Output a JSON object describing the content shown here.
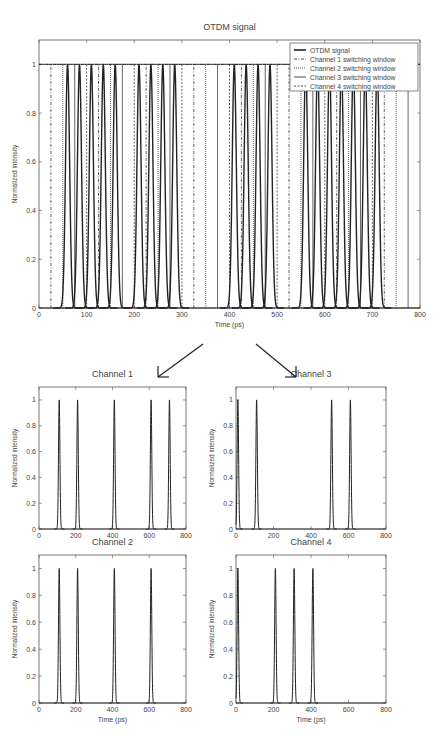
{
  "chart_data": [
    {
      "id": "main",
      "type": "line",
      "title": "OTDM signal",
      "xlabel": "Time (ps)",
      "ylabel": "Normalized intensity",
      "xlim": [
        0,
        800
      ],
      "ylim": [
        0,
        1.1
      ],
      "xticks": [
        0,
        100,
        200,
        300,
        400,
        500,
        600,
        700,
        800
      ],
      "yticks": [
        0,
        0.2,
        0.4,
        0.6,
        0.8,
        1
      ],
      "grid": false,
      "legend_position": "upper right",
      "legend": [
        {
          "label": "OTDM signal",
          "style": "solid-thick"
        },
        {
          "label": "Channel 1 switching window",
          "style": "dashdot"
        },
        {
          "label": "Channel 2 switching window",
          "style": "dotted"
        },
        {
          "label": "Channel 3 switching window",
          "style": "solid"
        },
        {
          "label": "Channel 4 switching window",
          "style": "dashed"
        }
      ],
      "series": [
        {
          "name": "OTDM signal",
          "pulse_centers_ps": [
            60,
            85,
            110,
            135,
            160,
            210,
            235,
            260,
            285,
            410,
            435,
            460,
            485,
            560,
            585,
            610,
            635,
            660,
            685,
            710
          ],
          "peak": 1.0,
          "pulse_width_ps": 10
        },
        {
          "name": "Channel 1 switching window",
          "window_edges_ps": [
            25,
            125,
            225,
            325,
            425,
            525,
            625,
            725
          ]
        },
        {
          "name": "Channel 2 switching window",
          "window_edges_ps": [
            50,
            150,
            250,
            350,
            450,
            550,
            650,
            750
          ]
        },
        {
          "name": "Channel 3 switching window",
          "window_edges_ps": [
            75,
            175,
            275,
            375,
            475,
            575,
            675,
            775
          ]
        },
        {
          "name": "Channel 4 switching window",
          "window_edges_ps": [
            0,
            100,
            200,
            300,
            400,
            500,
            600,
            700
          ]
        }
      ]
    },
    {
      "id": "ch1",
      "type": "line",
      "title": "Channel 1",
      "xlabel": "",
      "ylabel": "Normalized intensity",
      "xlim": [
        0,
        800
      ],
      "ylim": [
        0,
        1.1
      ],
      "xticks": [
        0,
        200,
        400,
        600,
        800
      ],
      "yticks": [
        0,
        0.2,
        0.4,
        0.6,
        0.8,
        1
      ],
      "series": [
        {
          "name": "Channel 1",
          "pulse_centers_ps": [
            110,
            210,
            410,
            610,
            710
          ],
          "peak": 1.0
        }
      ]
    },
    {
      "id": "ch3",
      "type": "line",
      "title": "Channel 3",
      "xlabel": "",
      "ylabel": "Normalized intensity",
      "xlim": [
        0,
        800
      ],
      "ylim": [
        0,
        1.1
      ],
      "xticks": [
        0,
        200,
        400,
        600,
        800
      ],
      "yticks": [
        0,
        0.2,
        0.4,
        0.6,
        0.8,
        1
      ],
      "series": [
        {
          "name": "Channel 3",
          "pulse_centers_ps": [
            10,
            110,
            510,
            610
          ],
          "peak": 1.0
        }
      ]
    },
    {
      "id": "ch2",
      "type": "line",
      "title": "Channel 2",
      "xlabel": "Time (ps)",
      "ylabel": "Normalized intensity",
      "xlim": [
        0,
        800
      ],
      "ylim": [
        0,
        1.1
      ],
      "xticks": [
        0,
        200,
        400,
        600,
        800
      ],
      "yticks": [
        0,
        0.2,
        0.4,
        0.6,
        0.8,
        1
      ],
      "series": [
        {
          "name": "Channel 2",
          "pulse_centers_ps": [
            110,
            210,
            410,
            610
          ],
          "peak": 1.0
        }
      ]
    },
    {
      "id": "ch4",
      "type": "line",
      "title": "Channel 4",
      "xlabel": "Time (ps)",
      "ylabel": "Normalized intensity",
      "xlim": [
        0,
        800
      ],
      "ylim": [
        0,
        1.1
      ],
      "xticks": [
        0,
        200,
        400,
        600,
        800
      ],
      "yticks": [
        0,
        0.2,
        0.4,
        0.6,
        0.8,
        1
      ],
      "series": [
        {
          "name": "Channel 4",
          "pulse_centers_ps": [
            10,
            210,
            310,
            410
          ],
          "peak": 1.0
        }
      ]
    }
  ],
  "layout": {
    "main": {
      "x": 39,
      "y": 40,
      "w": 381,
      "h": 268,
      "title_y": 22
    },
    "ch1": {
      "x": 39,
      "y": 387,
      "w": 147,
      "h": 142,
      "title_y": 369
    },
    "ch3": {
      "x": 236,
      "y": 387,
      "w": 150,
      "h": 142,
      "title_y": 369
    },
    "ch2": {
      "x": 39,
      "y": 555,
      "w": 147,
      "h": 148,
      "title_y": 537
    },
    "ch4": {
      "x": 236,
      "y": 555,
      "w": 150,
      "h": 148,
      "title_y": 537
    }
  },
  "arrows": [
    {
      "name": "arrow-to-channel-1",
      "from": [
        203,
        344
      ],
      "to": [
        158,
        377
      ]
    },
    {
      "name": "arrow-to-channel-3",
      "from": [
        256,
        344
      ],
      "to": [
        296,
        377
      ]
    }
  ],
  "colors": {
    "line": "#222222",
    "axis": "#555555",
    "text": "#444444",
    "background": "#ffffff"
  }
}
